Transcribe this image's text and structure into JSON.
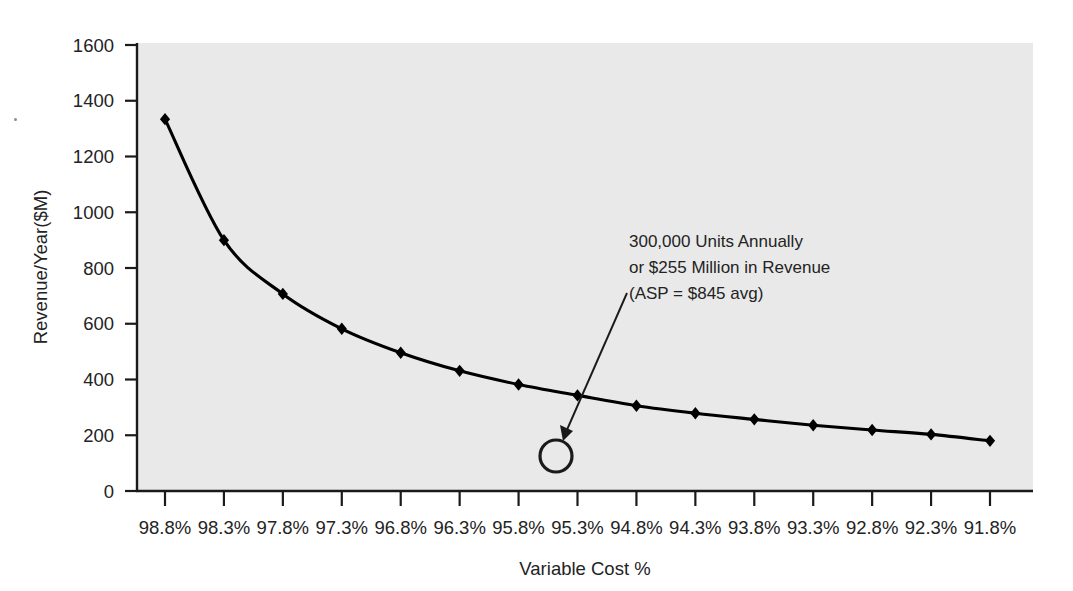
{
  "chart_data": {
    "type": "line",
    "title": "",
    "subtitle": "",
    "xlabel": "Variable Cost %",
    "ylabel": "Revenue/Year($M)",
    "categories": [
      "98.8%",
      "98.3%",
      "97.8%",
      "97.3%",
      "96.8%",
      "96.3%",
      "95.8%",
      "95.3%",
      "94.8%",
      "94.3%",
      "93.8%",
      "93.3%",
      "92.8%",
      "92.3%",
      "91.8%"
    ],
    "x_numeric": [
      98.8,
      98.3,
      97.8,
      97.3,
      96.8,
      96.3,
      95.8,
      95.3,
      94.8,
      94.3,
      93.8,
      93.3,
      92.8,
      92.3,
      91.8
    ],
    "values": [
      1334,
      900,
      707,
      582,
      496,
      431,
      382,
      343,
      306,
      279,
      257,
      236,
      219,
      203,
      180
    ],
    "series": [
      {
        "name": "Revenue/Year($M)",
        "values": [
          1334,
          900,
          707,
          582,
          496,
          431,
          382,
          343,
          306,
          279,
          257,
          236,
          219,
          203,
          180
        ],
        "marker": "diamond",
        "color": "#000000"
      }
    ],
    "ylim": [
      0,
      1600
    ],
    "y_ticks": [
      0,
      200,
      400,
      600,
      800,
      1000,
      1200,
      1400,
      1600
    ],
    "y_tick_labels": [
      "0",
      "200",
      "400",
      "600",
      "800",
      "1000",
      "1200",
      "1400",
      "1600"
    ],
    "grid": false,
    "legend": false,
    "legend_position": "none",
    "plot_background": "#e9e9e9",
    "figure_background": "#ffffff",
    "annotations": [
      {
        "name": "callout-300k-units",
        "lines": [
          "300,000 Units Annually",
          "or $255 Million in Revenue",
          "(ASP = $845 avg)"
        ],
        "marker": "circle",
        "marker_target_x": "95.4%",
        "marker_target_y": 125,
        "arrow": true
      }
    ]
  },
  "axes": {
    "y_title": "Revenue/Year($M)",
    "x_title": "Variable Cost %"
  }
}
